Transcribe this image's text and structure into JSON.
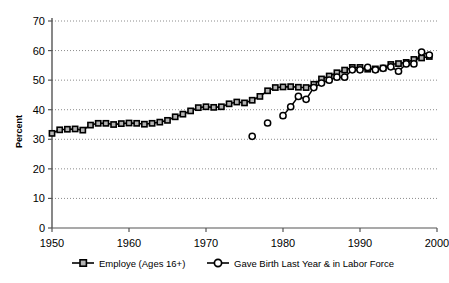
{
  "chart_data": {
    "type": "line",
    "title": "",
    "xlabel": "",
    "ylabel": "Percent",
    "xlim": [
      1950,
      2000
    ],
    "ylim": [
      0,
      70
    ],
    "ytick_labels": [
      "0",
      "10",
      "20",
      "30",
      "40",
      "50",
      "60",
      "70"
    ],
    "yticks": [
      0,
      10,
      20,
      30,
      40,
      50,
      60,
      70
    ],
    "xtick_labels": [
      "1950",
      "1960",
      "1970",
      "1980",
      "1990",
      "2000"
    ],
    "xticks": [
      1950,
      1960,
      1970,
      1980,
      1990,
      2000
    ],
    "grid": "horizontal-dotted",
    "legend_position": "bottom",
    "series": [
      {
        "name": "Employe (Ages 16+)",
        "marker": "square",
        "marker_fill": "#b3b3b3",
        "marker_edge": "#000000",
        "line_color": "#000000",
        "x": [
          1950,
          1951,
          1952,
          1953,
          1954,
          1955,
          1956,
          1957,
          1958,
          1959,
          1960,
          1961,
          1962,
          1963,
          1964,
          1965,
          1966,
          1967,
          1968,
          1969,
          1970,
          1971,
          1972,
          1973,
          1974,
          1975,
          1976,
          1977,
          1978,
          1979,
          1980,
          1981,
          1982,
          1983,
          1984,
          1985,
          1986,
          1987,
          1988,
          1989,
          1990,
          1991,
          1992,
          1993,
          1994,
          1995,
          1996,
          1997,
          1998,
          1999
        ],
        "values": [
          32.0,
          33.2,
          33.4,
          33.5,
          33.1,
          34.8,
          35.4,
          35.4,
          35.0,
          35.3,
          35.5,
          35.4,
          35.1,
          35.4,
          35.8,
          36.4,
          37.6,
          38.5,
          39.6,
          40.7,
          41.0,
          40.8,
          41.0,
          42.0,
          42.6,
          42.3,
          43.2,
          44.5,
          46.4,
          47.5,
          47.7,
          47.8,
          47.6,
          47.5,
          48.6,
          50.4,
          51.4,
          52.5,
          53.4,
          54.3,
          54.3,
          53.7,
          53.8,
          54.1,
          55.3,
          55.6,
          56.0,
          57.0,
          57.5,
          58.0
        ]
      },
      {
        "name": "Gave Birth Last Year & in Labor Force",
        "marker": "circle",
        "marker_fill": "#ffffff",
        "marker_edge": "#000000",
        "line_color": "#000000",
        "x": [
          1976,
          1978,
          1980,
          1981,
          1982,
          1983,
          1984,
          1985,
          1986,
          1987,
          1988,
          1989,
          1990,
          1991,
          1992,
          1993,
          1994,
          1995,
          1996,
          1997,
          1998,
          1999
        ],
        "values": [
          31.0,
          35.5,
          38.0,
          41.0,
          44.5,
          43.5,
          47.5,
          49.0,
          50.0,
          51.0,
          51.0,
          53.5,
          53.5,
          54.3,
          53.5,
          54.0,
          54.5,
          53.0,
          55.5,
          55.5,
          59.5,
          58.5
        ],
        "connected_from": 1980,
        "isolated_points": [
          1976,
          1978
        ]
      }
    ]
  },
  "legend": {
    "items": [
      {
        "label": "Employe (Ages 16+)",
        "marker": "square-marker-icon"
      },
      {
        "label": "Gave Birth Last Year & in Labor Force",
        "marker": "circle-marker-icon"
      }
    ]
  }
}
